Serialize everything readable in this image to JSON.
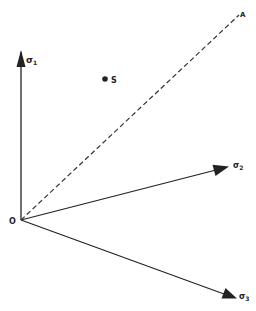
{
  "diagram": {
    "type": "stress-space vectors",
    "colors": {
      "line": "#222222",
      "background": "#ffffff"
    },
    "origin": {
      "label": "O",
      "x": 21,
      "y": 220
    },
    "axes": [
      {
        "name": "sigma1",
        "symbol": "σ",
        "subscript": "1",
        "end": {
          "x": 21,
          "y": 50
        }
      },
      {
        "name": "sigma2",
        "symbol": "σ",
        "subscript": "2",
        "end": {
          "x": 228,
          "y": 167
        }
      },
      {
        "name": "sigma3",
        "symbol": "σ",
        "subscript": "3",
        "end": {
          "x": 236,
          "y": 298
        }
      }
    ],
    "hydrostatic_line": {
      "label": "A",
      "style": "dashed",
      "end": {
        "x": 240,
        "y": 14
      }
    },
    "point": {
      "label": "S",
      "x": 105,
      "y": 79
    }
  }
}
